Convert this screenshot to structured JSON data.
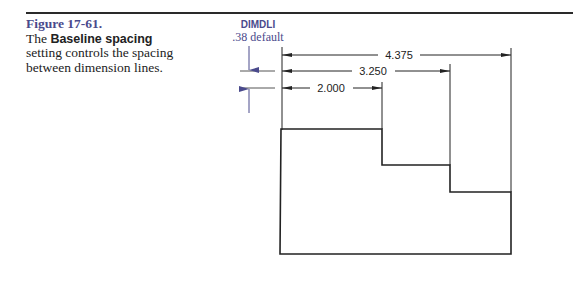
{
  "caption": {
    "figure_label": "Figure 17-61.",
    "text_before": "The ",
    "bold_term": "Baseline spacing",
    "text_after": " setting controls the spacing between dimension lines."
  },
  "annotation": {
    "variable": "DIMDLI",
    "default": ".38 default"
  },
  "dimensions": [
    {
      "label": "4.375",
      "y": 55,
      "x_end": 511
    },
    {
      "label": "3.250",
      "y": 71,
      "x_end": 450
    },
    {
      "label": "2.000",
      "y": 88,
      "x_end": 382
    }
  ],
  "colors": {
    "accent": "#4a4a8c",
    "line": "#222222"
  }
}
